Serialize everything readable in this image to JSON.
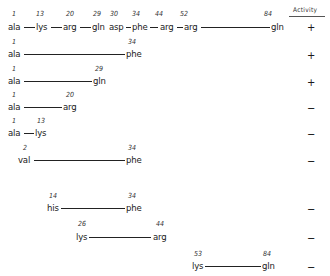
{
  "activity_header": "Activity",
  "rows": [
    {
      "residues": [
        {
          "num": "1",
          "name": "ala"
        },
        {
          "num": "13",
          "name": "lys"
        },
        {
          "num": "20",
          "name": "arg"
        },
        {
          "num": "29",
          "name": "gln"
        },
        {
          "num": "30",
          "name": "asp"
        },
        {
          "num": "34",
          "name": "phe"
        },
        {
          "num": "44",
          "name": "arg"
        },
        {
          "num": "52",
          "name": "arg"
        },
        {
          "num": "84",
          "name": "gln"
        }
      ],
      "activity": "+"
    },
    {
      "start": {
        "num": "1",
        "name": "ala"
      },
      "end": {
        "num": "34",
        "name": "phe"
      },
      "activity": "+"
    },
    {
      "start": {
        "num": "1",
        "name": "ala"
      },
      "end": {
        "num": "29",
        "name": "gln"
      },
      "activity": "+"
    },
    {
      "start": {
        "num": "1",
        "name": "ala"
      },
      "end": {
        "num": "20",
        "name": "arg"
      },
      "activity": "−"
    },
    {
      "start": {
        "num": "1",
        "name": "ala"
      },
      "end": {
        "num": "13",
        "name": "lys"
      },
      "activity": "−"
    },
    {
      "start": {
        "num": "2",
        "name": "val"
      },
      "end": {
        "num": "34",
        "name": "phe"
      },
      "activity": "−"
    },
    {
      "start": {
        "num": "14",
        "name": "his"
      },
      "end": {
        "num": "34",
        "name": "phe"
      },
      "activity": "−"
    },
    {
      "start": {
        "num": "26",
        "name": "lys"
      },
      "end": {
        "num": "44",
        "name": "arg"
      },
      "activity": "−"
    },
    {
      "start": {
        "num": "53",
        "name": "lys"
      },
      "end": {
        "num": "84",
        "name": "gln"
      },
      "activity": "−"
    }
  ]
}
